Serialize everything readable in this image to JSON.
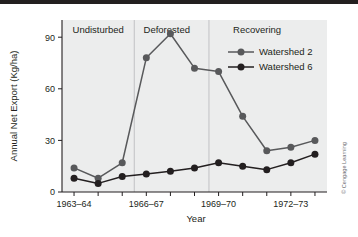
{
  "figure": {
    "credit": "© Cengage Learning",
    "copyright_symbol": "©"
  },
  "chart_data": {
    "type": "line",
    "title": "",
    "xlabel": "Year",
    "ylabel": "Annual Net Export (Kg/ha)",
    "x": [
      "1963-64",
      "1964-65",
      "1965-66",
      "1966-67",
      "1967-68",
      "1968-69",
      "1969-70",
      "1970-71",
      "1971-72",
      "1972-73",
      "1973-74"
    ],
    "tick_labels": [
      "1963–64",
      "1966–67",
      "1969–70",
      "1972–73"
    ],
    "tick_label_indices": [
      0,
      3,
      6,
      9
    ],
    "ylim": [
      0,
      100
    ],
    "yticks": [
      0,
      30,
      60,
      90
    ],
    "ytick_labels": [
      "0",
      "30",
      "60",
      "90"
    ],
    "grid": false,
    "legend_position": "upper-right",
    "series": [
      {
        "name": "Watershed 2",
        "color": "#58595b",
        "values": [
          14,
          8,
          17,
          78,
          92,
          72,
          70,
          44,
          24,
          26,
          30
        ]
      },
      {
        "name": "Watershed 6",
        "color": "#231f20",
        "values": [
          8,
          5,
          9,
          10.5,
          12,
          14,
          17,
          15,
          13,
          17,
          22
        ]
      }
    ],
    "annotations": [
      {
        "text": "Undisturbed",
        "x_index": 1.0
      },
      {
        "text": "Deforested",
        "x_index": 3.85
      },
      {
        "text": "Recovering",
        "x_index": 7.6
      }
    ],
    "region_dividers": [
      2.5,
      5.6
    ]
  }
}
